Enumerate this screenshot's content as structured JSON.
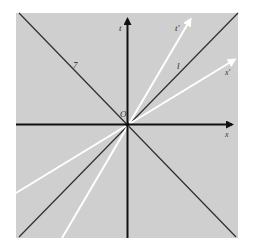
{
  "diagram": {
    "background_color": "#ffffff",
    "panel_color": "#cfcfcf",
    "axis_color": "#111111",
    "light_line_color": "#333333",
    "boosted_axis_color": "#ffffff",
    "labels": {
      "t_axis": "t",
      "x_axis": "x",
      "t_prime": "t'",
      "x_prime": "x'",
      "light_line_l": "l",
      "light_line_other": "7",
      "origin": "O"
    }
  }
}
